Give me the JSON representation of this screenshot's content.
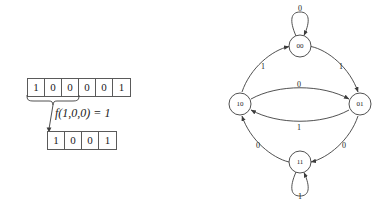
{
  "tape_diagram": {
    "input_tape": {
      "name": "input-tape",
      "cells": [
        "1",
        "0",
        "0",
        "0",
        "0",
        "1"
      ]
    },
    "brace": {
      "name": "neighborhood-brace",
      "spans_cells": 3
    },
    "rule_label": {
      "prefix": "f",
      "args": "(1,0,0)",
      "equals": " = ",
      "result": "1",
      "full": "f(1,0,0) = 1"
    },
    "output_tape": {
      "name": "output-tape",
      "cells": [
        "1",
        "0",
        "0",
        "1"
      ]
    }
  },
  "state_diagram": {
    "nodes": [
      {
        "id": "00",
        "label": "00",
        "cx": 82,
        "cy": 42
      },
      {
        "id": "10",
        "label": "10",
        "cx": 22,
        "cy": 100
      },
      {
        "id": "01",
        "label": "01",
        "cx": 142,
        "cy": 100
      },
      {
        "id": "11",
        "label": "11",
        "cx": 82,
        "cy": 158
      }
    ],
    "edges": [
      {
        "from": "10",
        "to": "00",
        "label": "1",
        "lx": 43,
        "ly": 58
      },
      {
        "from": "00",
        "to": "01",
        "label": "1",
        "lx": 121,
        "ly": 58
      },
      {
        "from": "10",
        "to": "01",
        "label": "0",
        "lx": 79,
        "ly": 80
      },
      {
        "from": "01",
        "to": "10",
        "label": "1",
        "lx": 79,
        "ly": 118
      },
      {
        "from": "11",
        "to": "10",
        "label": "0",
        "lx": 38,
        "ly": 138
      },
      {
        "from": "01",
        "to": "11",
        "label": "0",
        "lx": 125,
        "ly": 138
      },
      {
        "from": "00",
        "to": "00",
        "label": "0",
        "lx": 80,
        "ly": 4
      },
      {
        "from": "11",
        "to": "11",
        "label": "1",
        "lx": 80,
        "ly": 188
      }
    ],
    "colors": {
      "stroke": "#3d3d3d",
      "text": "#1a1a1a",
      "background": "#ffffff"
    }
  }
}
